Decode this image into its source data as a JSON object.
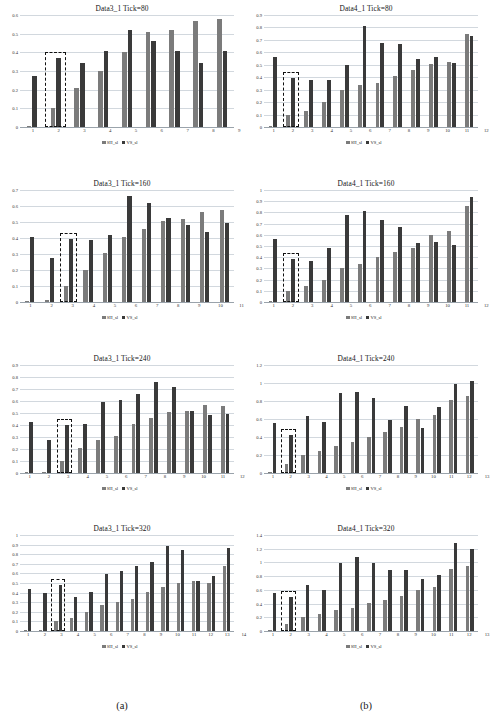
{
  "figure": {
    "caption_a": "(a)",
    "caption_b": "(b)",
    "series_names": [
      "SH_sl",
      "VS_sl"
    ],
    "colors": {
      "series1": "#7b7b7b",
      "series2": "#3a3a3a",
      "gridline": "#d2d8de",
      "highlight_box": "#111111"
    }
  },
  "chart_data": [
    {
      "type": "bar",
      "title": "Data3_1 Tick=80",
      "panel": "a",
      "xlabel": "",
      "ylabel": "",
      "ylim": [
        0,
        0.6
      ],
      "yticks": [
        0,
        0.1,
        0.2,
        0.3,
        0.4,
        0.5,
        0.6
      ],
      "ytick_labels": [
        "0",
        "0.1",
        "0.2",
        "0.3",
        "0.4",
        "0.5",
        "0.6"
      ],
      "grid": true,
      "legend_position": "bottom",
      "categories": [
        "1",
        "2",
        "3",
        "4",
        "5",
        "6",
        "7",
        "8",
        "9"
      ],
      "series": [
        {
          "name": "SH_sl",
          "values": [
            0.005,
            0.1,
            0.21,
            0.3,
            0.4,
            0.51,
            0.52,
            0.57,
            0.58
          ]
        },
        {
          "name": "VS_sl",
          "values": [
            0.275,
            0.37,
            0.345,
            0.405,
            0.52,
            0.46,
            0.405,
            0.345,
            0.405
          ]
        }
      ],
      "highlight": {
        "category": "2",
        "index": 1
      }
    },
    {
      "type": "bar",
      "title": "Data4_1 Tick=80",
      "panel": "b",
      "xlabel": "",
      "ylabel": "",
      "ylim": [
        0,
        0.9
      ],
      "yticks": [
        0,
        0.1,
        0.2,
        0.3,
        0.4,
        0.5,
        0.6,
        0.7,
        0.8,
        0.9
      ],
      "ytick_labels": [
        "0",
        "0.1",
        "0.2",
        "0.3",
        "0.4",
        "0.5",
        "0.6",
        "0.7",
        "0.8",
        "0.9"
      ],
      "grid": true,
      "legend_position": "bottom",
      "categories": [
        "1",
        "2",
        "3",
        "4",
        "5",
        "6",
        "7",
        "8",
        "9",
        "10",
        "11",
        "12"
      ],
      "series": [
        {
          "name": "SH_sl",
          "values": [
            0.005,
            0.1,
            0.13,
            0.2,
            0.3,
            0.34,
            0.355,
            0.41,
            0.455,
            0.505,
            0.525,
            0.75
          ]
        },
        {
          "name": "VS_sl",
          "values": [
            0.56,
            0.39,
            0.38,
            0.38,
            0.5,
            0.81,
            0.675,
            0.665,
            0.545,
            0.56,
            0.515,
            0.735
          ]
        }
      ],
      "highlight": {
        "category": "2",
        "index": 1
      }
    },
    {
      "type": "bar",
      "title": "Data3_1 Tick=160",
      "panel": "a",
      "xlabel": "",
      "ylabel": "",
      "ylim": [
        0,
        0.7
      ],
      "yticks": [
        0,
        0.1,
        0.2,
        0.3,
        0.4,
        0.5,
        0.6,
        0.7
      ],
      "ytick_labels": [
        "0",
        "0.1",
        "0.2",
        "0.3",
        "0.4",
        "0.5",
        "0.6",
        "0.7"
      ],
      "grid": true,
      "legend_position": "bottom",
      "categories": [
        "1",
        "2",
        "3",
        "4",
        "5",
        "6",
        "7",
        "8",
        "9",
        "10",
        "11"
      ],
      "series": [
        {
          "name": "SH_sl",
          "values": [
            0.005,
            0.01,
            0.1,
            0.2,
            0.305,
            0.405,
            0.455,
            0.505,
            0.52,
            0.565,
            0.575
          ]
        },
        {
          "name": "VS_sl",
          "values": [
            0.405,
            0.275,
            0.395,
            0.39,
            0.42,
            0.665,
            0.62,
            0.525,
            0.48,
            0.44,
            0.495
          ]
        }
      ],
      "highlight": {
        "category": "3",
        "index": 2
      }
    },
    {
      "type": "bar",
      "title": "Data4_1 Tick=160",
      "panel": "b",
      "xlabel": "",
      "ylabel": "",
      "ylim": [
        0,
        1.0
      ],
      "yticks": [
        0,
        0.1,
        0.2,
        0.3,
        0.4,
        0.5,
        0.6,
        0.7,
        0.8,
        0.9,
        1
      ],
      "ytick_labels": [
        "0",
        "0.1",
        "0.2",
        "0.3",
        "0.4",
        "0.5",
        "0.6",
        "0.7",
        "0.8",
        "0.9",
        "1"
      ],
      "grid": true,
      "legend_position": "bottom",
      "categories": [
        "1",
        "2",
        "3",
        "4",
        "5",
        "6",
        "7",
        "8",
        "9",
        "10",
        "11",
        "12"
      ],
      "series": [
        {
          "name": "SH_sl",
          "values": [
            0.005,
            0.1,
            0.14,
            0.2,
            0.305,
            0.335,
            0.405,
            0.45,
            0.48,
            0.6,
            0.63,
            0.855
          ]
        },
        {
          "name": "VS_sl",
          "values": [
            0.56,
            0.385,
            0.37,
            0.48,
            0.775,
            0.81,
            0.73,
            0.67,
            0.525,
            0.54,
            0.51,
            0.94
          ]
        }
      ],
      "highlight": {
        "category": "2",
        "index": 1
      }
    },
    {
      "type": "bar",
      "title": "Data3_1 Tick=240",
      "panel": "a",
      "xlabel": "",
      "ylabel": "",
      "ylim": [
        0,
        0.9
      ],
      "yticks": [
        0,
        0.1,
        0.2,
        0.3,
        0.4,
        0.5,
        0.6,
        0.7,
        0.8,
        0.9
      ],
      "ytick_labels": [
        "0",
        "0.1",
        "0.2",
        "0.3",
        "0.4",
        "0.5",
        "0.6",
        "0.7",
        "0.8",
        "0.9"
      ],
      "grid": true,
      "legend_position": "bottom",
      "categories": [
        "1",
        "2",
        "3",
        "4",
        "5",
        "6",
        "7",
        "8",
        "9",
        "10",
        "11",
        "12"
      ],
      "series": [
        {
          "name": "SH_sl",
          "values": [
            0.005,
            0.01,
            0.1,
            0.205,
            0.275,
            0.305,
            0.405,
            0.455,
            0.505,
            0.52,
            0.565,
            0.555
          ]
        },
        {
          "name": "VS_sl",
          "values": [
            0.425,
            0.275,
            0.4,
            0.405,
            0.59,
            0.61,
            0.66,
            0.755,
            0.72,
            0.52,
            0.48,
            0.49
          ]
        }
      ],
      "highlight": {
        "category": "3",
        "index": 2
      }
    },
    {
      "type": "bar",
      "title": "Data4_1 Tick=240",
      "panel": "b",
      "xlabel": "",
      "ylabel": "",
      "ylim": [
        0,
        1.2
      ],
      "yticks": [
        0,
        0.2,
        0.4,
        0.6,
        0.8,
        1,
        1.2
      ],
      "ytick_labels": [
        "0",
        "0.2",
        "0.4",
        "0.6",
        "0.8",
        "1",
        "1.2"
      ],
      "grid": true,
      "legend_position": "bottom",
      "categories": [
        "1",
        "2",
        "3",
        "4",
        "5",
        "6",
        "7",
        "8",
        "9",
        "10",
        "11",
        "12",
        "13"
      ],
      "series": [
        {
          "name": "SH_sl",
          "values": [
            0.01,
            0.1,
            0.2,
            0.25,
            0.305,
            0.34,
            0.405,
            0.455,
            0.51,
            0.605,
            0.64,
            0.81,
            0.86
          ]
        },
        {
          "name": "VS_sl",
          "values": [
            0.56,
            0.425,
            0.63,
            0.565,
            0.885,
            0.905,
            0.835,
            0.585,
            0.74,
            0.5,
            0.73,
            0.985,
            1.02
          ]
        }
      ],
      "highlight": {
        "category": "2",
        "index": 1
      }
    },
    {
      "type": "bar",
      "title": "Data3_1 Tick=320",
      "panel": "a",
      "xlabel": "",
      "ylabel": "",
      "ylim": [
        0,
        1.0
      ],
      "yticks": [
        0,
        0.1,
        0.2,
        0.3,
        0.4,
        0.5,
        0.6,
        0.7,
        0.8,
        0.9,
        1
      ],
      "ytick_labels": [
        "0",
        "0.1",
        "0.2",
        "0.3",
        "0.4",
        "0.5",
        "0.6",
        "0.7",
        "0.8",
        "0.9",
        "1"
      ],
      "grid": true,
      "legend_position": "bottom",
      "categories": [
        "1",
        "2",
        "3",
        "4",
        "5",
        "6",
        "7",
        "8",
        "9",
        "10",
        "11",
        "12",
        "13",
        "14"
      ],
      "series": [
        {
          "name": "SH_sl",
          "values": [
            0.005,
            0.005,
            0.1,
            0.135,
            0.2,
            0.275,
            0.305,
            0.335,
            0.405,
            0.455,
            0.505,
            0.52,
            0.495,
            0.675
          ]
        },
        {
          "name": "VS_sl",
          "values": [
            0.435,
            0.395,
            0.475,
            0.355,
            0.41,
            0.59,
            0.625,
            0.68,
            0.715,
            0.89,
            0.845,
            0.52,
            0.575,
            0.865
          ]
        }
      ],
      "highlight": {
        "category": "3",
        "index": 2
      }
    },
    {
      "type": "bar",
      "title": "Data4_1 Tick=320",
      "panel": "b",
      "xlabel": "",
      "ylabel": "",
      "ylim": [
        0,
        1.4
      ],
      "yticks": [
        0,
        0.2,
        0.4,
        0.6,
        0.8,
        1,
        1.2,
        1.4
      ],
      "ytick_labels": [
        "0",
        "0.2",
        "0.4",
        "0.6",
        "0.8",
        "1",
        "1.2",
        "1.4"
      ],
      "grid": true,
      "legend_position": "bottom",
      "categories": [
        "1",
        "2",
        "3",
        "4",
        "5",
        "6",
        "7",
        "8",
        "9",
        "10",
        "11",
        "12",
        "13"
      ],
      "series": [
        {
          "name": "SH_sl",
          "values": [
            0.01,
            0.1,
            0.205,
            0.255,
            0.305,
            0.34,
            0.405,
            0.455,
            0.505,
            0.605,
            0.64,
            0.905,
            0.955
          ]
        },
        {
          "name": "VS_sl",
          "values": [
            0.56,
            0.49,
            0.665,
            0.605,
            0.985,
            1.08,
            0.985,
            0.885,
            0.89,
            0.765,
            0.82,
            1.29,
            1.19
          ]
        }
      ],
      "highlight": {
        "category": "2",
        "index": 1
      }
    }
  ]
}
